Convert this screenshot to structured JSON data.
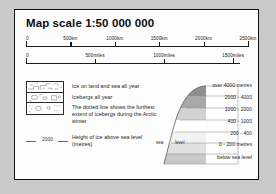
{
  "panel": {
    "title": "Map scale  1:50 000 000",
    "background": "#fdfdfd",
    "border_color": "#111111"
  },
  "scales": [
    {
      "id": "km",
      "unit": "km",
      "ticks": [
        {
          "label": "0",
          "pos_pct": 0
        },
        {
          "label": "500km",
          "pos_pct": 20
        },
        {
          "label": "1000km",
          "pos_pct": 40
        },
        {
          "label": "1500km",
          "pos_pct": 60
        },
        {
          "label": "2000km",
          "pos_pct": 80
        },
        {
          "label": "2500km",
          "pos_pct": 100
        }
      ]
    },
    {
      "id": "miles",
      "unit": "miles",
      "ticks": [
        {
          "label": "0",
          "pos_pct": 0
        },
        {
          "label": "500miles",
          "pos_pct": 32.2
        },
        {
          "label": "1000miles",
          "pos_pct": 64.4
        },
        {
          "label": "1500miles",
          "pos_pct": 96.6
        }
      ]
    }
  ],
  "key": {
    "symbol_box_rows": [
      {
        "name": "ice-on-land-and-sea-symbol"
      },
      {
        "name": "icebergs-symbol"
      },
      {
        "name": "iceberg-extent-symbol"
      }
    ],
    "entries": [
      {
        "text": "Ice on land and sea all year"
      },
      {
        "text": "Icebergs all year"
      },
      {
        "text": "The dotted line shows the furthest extent of icebergs during the Arctic winter"
      },
      {
        "text": "Height of ice above sea level (metres)"
      }
    ],
    "contour_sample_value": "2000"
  },
  "elevation_key": {
    "sea_level_label_left": "sea",
    "sea_level_label_right": "level",
    "bands": [
      {
        "label": "over 4000 metres",
        "color": "#8f8f8f"
      },
      {
        "label": "2000 - 4000",
        "color": "#a8a8a8"
      },
      {
        "label": "1000 - 2000",
        "color": "#d2d2d2"
      },
      {
        "label": "400 - 1000",
        "color": "#ffffff"
      },
      {
        "label": "200 - 400",
        "color": "#f2f2f2"
      },
      {
        "label": "0 - 200 metres",
        "color": "#e0e0e0"
      },
      {
        "label": "below sea level",
        "color": "#c9c9c9"
      }
    ]
  }
}
